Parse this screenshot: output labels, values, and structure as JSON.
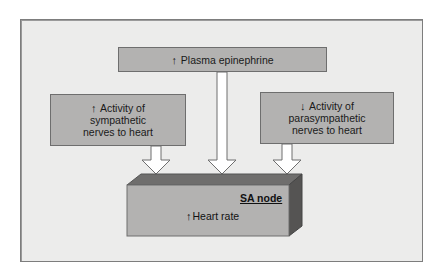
{
  "diagram": {
    "top_box": {
      "arrow": "↑",
      "label": "Plasma epinephrine"
    },
    "left_box": {
      "arrow": "↑",
      "lines": [
        "Activity of",
        "sympathetic",
        "nerves to heart"
      ]
    },
    "right_box": {
      "arrow": "↓",
      "lines": [
        "Activity of",
        "parasympathetic",
        "nerves to heart"
      ]
    },
    "target": {
      "title": "SA node",
      "arrow": "↑",
      "effect": "Heart rate"
    },
    "colors": {
      "panel": "#ececeb",
      "box_fill": "#b3b2b1",
      "block_top": "#6f6e6d",
      "block_side": "#555453",
      "arrow_fill": "#ffffff"
    }
  }
}
